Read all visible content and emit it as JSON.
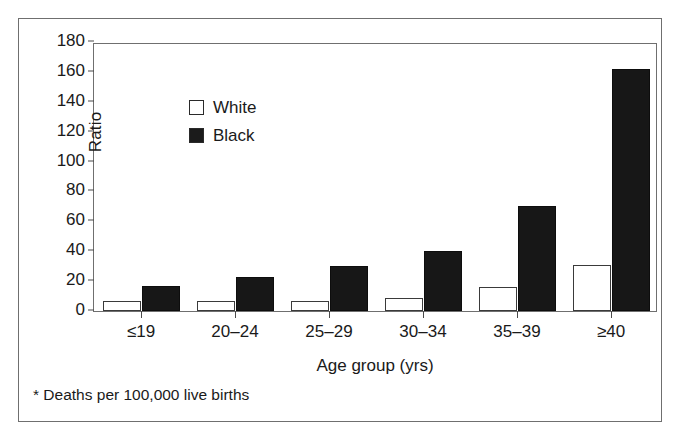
{
  "chart_data": {
    "type": "bar",
    "title": "",
    "xlabel": "Age group (yrs)",
    "ylabel": "Ratio",
    "ylim": [
      0,
      180
    ],
    "yticks": [
      0,
      20,
      40,
      60,
      80,
      100,
      120,
      140,
      160,
      180
    ],
    "grid": false,
    "legend_position": "top-left",
    "categories": [
      "≤19",
      "20–24",
      "25–29",
      "30–34",
      "35–39",
      "≥40"
    ],
    "series": [
      {
        "name": "White",
        "color": "#ffffff",
        "values": [
          7,
          7,
          7,
          9,
          16,
          31
        ]
      },
      {
        "name": "Black",
        "color": "#171717",
        "values": [
          17,
          23,
          30,
          40,
          70,
          162
        ]
      }
    ],
    "footnote": "* Deaths per 100,000 live births"
  },
  "legend": {
    "items": [
      {
        "label": "White",
        "swatch": "open-square"
      },
      {
        "label": "Black",
        "swatch": "filled-square"
      }
    ]
  },
  "axes": {
    "y_title": "Ratio",
    "x_title": "Age group (yrs)",
    "y_tick_labels": [
      "180",
      "160",
      "140",
      "120",
      "100",
      "80",
      "60",
      "40",
      "20",
      "0"
    ],
    "x_tick_labels": [
      "≤19",
      "20–24",
      "25–29",
      "30–34",
      "35–39",
      "≥40"
    ]
  },
  "footnote": {
    "text": "* Deaths per 100,000 live births"
  }
}
